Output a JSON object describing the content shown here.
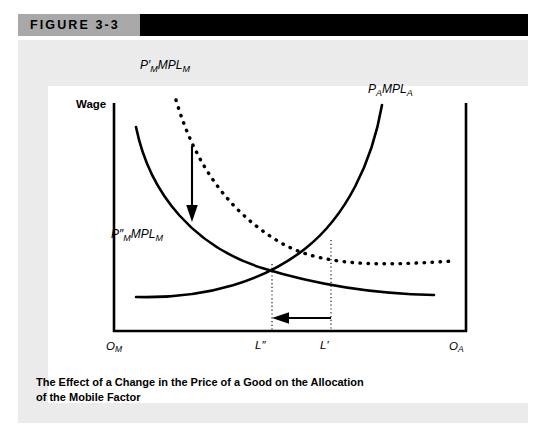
{
  "figure": {
    "header_label": "FIGURE 3-3",
    "caption_lines": [
      "The Effect of a Change in the Price of a Good on the Allocation",
      "of the Mobile Factor"
    ],
    "colors": {
      "ink": "#000000",
      "header_gray": "#a8a8a8",
      "header_black": "#000000",
      "panel_gray": "#ebebeb",
      "plot_white": "#ffffff"
    }
  },
  "axes": {
    "y_axis_label": "Wage",
    "origin_left": {
      "base": "O",
      "sub": "M"
    },
    "origin_right": {
      "base": "O",
      "sub": "A"
    },
    "tick_labels": [
      {
        "base": "L",
        "prime": "″",
        "sub": ""
      },
      {
        "base": "L",
        "prime": "′",
        "sub": ""
      }
    ]
  },
  "curves": [
    {
      "name": "manufacturing-initial",
      "label": {
        "base": "P",
        "prime": "′",
        "sub1": "M",
        "mid": "MPL",
        "sub2": "M"
      },
      "style": "dotted",
      "slope": "downward",
      "origin": "left"
    },
    {
      "name": "manufacturing-after",
      "label": {
        "base": "P",
        "prime": "″",
        "sub1": "M",
        "mid": "MPL",
        "sub2": "M"
      },
      "style": "solid",
      "slope": "downward",
      "origin": "left"
    },
    {
      "name": "agriculture",
      "label": {
        "base": "P",
        "prime": "",
        "sub1": "A",
        "mid": "MPL",
        "sub2": "A"
      },
      "style": "solid",
      "slope": "upward",
      "origin": "right"
    }
  ],
  "annotations": [
    {
      "name": "downward-shift-arrow",
      "direction": "down"
    },
    {
      "name": "labor-reallocation-arrow",
      "direction": "left"
    }
  ],
  "chart_data": {
    "type": "line",
    "title": "The Effect of a Change in the Price of a Good on the Allocation of the Mobile Factor",
    "xlabel": "",
    "ylabel": "Wage",
    "grid": false,
    "legend": "inline-curve-labels",
    "xlim": [
      0,
      100
    ],
    "ylim": [
      0,
      100
    ],
    "x_tick_positions": [
      0,
      47,
      63,
      100
    ],
    "x_tick_labels": [
      "O_M",
      "L″",
      "L′",
      "O_A"
    ],
    "series": [
      {
        "name": "P′_M MPL_M",
        "style": "dotted",
        "points": [
          [
            11,
            100
          ],
          [
            14,
            88
          ],
          [
            18,
            78
          ],
          [
            23,
            68
          ],
          [
            29,
            59
          ],
          [
            36,
            51
          ],
          [
            44,
            44
          ],
          [
            53,
            39
          ],
          [
            63,
            35
          ],
          [
            74,
            32
          ],
          [
            86,
            30
          ],
          [
            97,
            29
          ]
        ]
      },
      {
        "name": "P″_M MPL_M",
        "style": "solid",
        "points": [
          [
            5,
            86
          ],
          [
            7,
            73
          ],
          [
            10,
            63
          ],
          [
            14,
            54
          ],
          [
            20,
            45
          ],
          [
            27,
            37
          ],
          [
            36,
            30
          ],
          [
            47,
            25
          ],
          [
            60,
            21
          ],
          [
            74,
            19
          ],
          [
            88,
            18
          ],
          [
            97,
            18
          ]
        ]
      },
      {
        "name": "P_A MPL_A",
        "style": "solid",
        "points": [
          [
            5,
            18
          ],
          [
            17,
            19
          ],
          [
            28,
            21
          ],
          [
            38,
            24
          ],
          [
            47,
            28
          ],
          [
            56,
            33
          ],
          [
            63,
            39
          ],
          [
            70,
            47
          ],
          [
            76,
            57
          ],
          [
            81,
            69
          ],
          [
            85,
            82
          ],
          [
            87,
            95
          ]
        ]
      }
    ],
    "intersections": [
      {
        "name": "after-shift-equilibrium",
        "x": 47,
        "y": 25,
        "tick": "L″"
      },
      {
        "name": "initial-equilibrium",
        "x": 63,
        "y": 35,
        "tick": "L′"
      }
    ]
  }
}
